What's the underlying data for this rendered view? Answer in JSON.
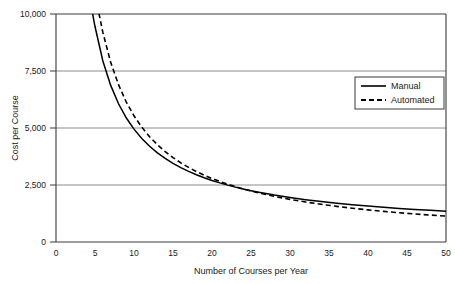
{
  "chart_data": {
    "type": "line",
    "title": "",
    "subtitle": "",
    "xlabel": "Number of Courses per Year",
    "ylabel": "Cost per Course",
    "xlim": [
      0,
      50
    ],
    "ylim": [
      0,
      10000
    ],
    "xticks": [
      0,
      5,
      10,
      15,
      20,
      25,
      30,
      35,
      40,
      45,
      50
    ],
    "xtick_labels": [
      "0",
      "5",
      "10",
      "15",
      "20",
      "25",
      "30",
      "35",
      "40",
      "45",
      "50"
    ],
    "yticks": [
      0,
      2500,
      5000,
      7500,
      10000
    ],
    "ytick_labels": [
      "0",
      "2,500",
      "5,000",
      "7,500",
      "10,000"
    ],
    "grid": "horizontal",
    "legend_position": "upper right",
    "annotations": [],
    "series": [
      {
        "name": "Manual",
        "style": "solid",
        "color": "#000000",
        "x": [
          4.7,
          5,
          6,
          7,
          8,
          9,
          10,
          11,
          12,
          13,
          14,
          15,
          16,
          17,
          18,
          19,
          20,
          21,
          22,
          23,
          24,
          25,
          26,
          28,
          30,
          32,
          34,
          36,
          38,
          40,
          42,
          44,
          46,
          48,
          50
        ],
        "y": [
          10000,
          9450,
          7950,
          6879,
          6075,
          5450,
          4950,
          4541,
          4200,
          3912,
          3664,
          3450,
          3263,
          3097,
          2950,
          2818,
          2700,
          2593,
          2495,
          2407,
          2325,
          2250,
          2181,
          2057,
          1950,
          1856,
          1774,
          1700,
          1634,
          1575,
          1521,
          1473,
          1428,
          1388,
          1350
        ]
      },
      {
        "name": "Automated",
        "style": "dashed",
        "color": "#000000",
        "x": [
          5.5,
          6,
          7,
          8,
          9,
          10,
          11,
          12,
          13,
          14,
          15,
          16,
          17,
          18,
          19,
          20,
          21,
          22,
          23,
          24,
          25,
          26,
          28,
          30,
          32,
          34,
          36,
          38,
          40,
          42,
          44,
          46,
          48,
          50
        ],
        "y": [
          10035,
          9202,
          7893,
          6910,
          6146,
          5535,
          5035,
          4618,
          4266,
          3964,
          3702,
          3473,
          3271,
          3091,
          2930,
          2785,
          2654,
          2535,
          2426,
          2326,
          2235,
          2150,
          2000,
          1868,
          1754,
          1653,
          1562,
          1482,
          1410,
          1344,
          1285,
          1231,
          1181,
          1135
        ]
      }
    ],
    "curve_models": {
      "Manual": {
        "formula": "45000/x + 450",
        "fixed_cost": 45000,
        "variable_cost": 450
      },
      "Automated": {
        "formula": "55000/x + 35",
        "fixed_cost": 55000,
        "variable_cost": 35
      }
    },
    "crossover": {
      "x": 22,
      "y": 2500
    }
  },
  "legend": {
    "items": [
      {
        "label": "Manual",
        "style": "solid"
      },
      {
        "label": "Automated",
        "style": "dashed"
      }
    ]
  },
  "axes": {
    "y_label": "Cost per Course",
    "x_label": "Number of Courses per Year",
    "y_ticks": [
      "10,000",
      "7,500",
      "5,000",
      "2,500",
      "0"
    ],
    "x_ticks": [
      "0",
      "5",
      "10",
      "15",
      "20",
      "25",
      "30",
      "35",
      "40",
      "45",
      "50"
    ]
  },
  "colors": {
    "series_line": "#000000",
    "grid": "#888888",
    "frame": "#333333",
    "background": "#ffffff",
    "text": "#1a1a1a"
  }
}
